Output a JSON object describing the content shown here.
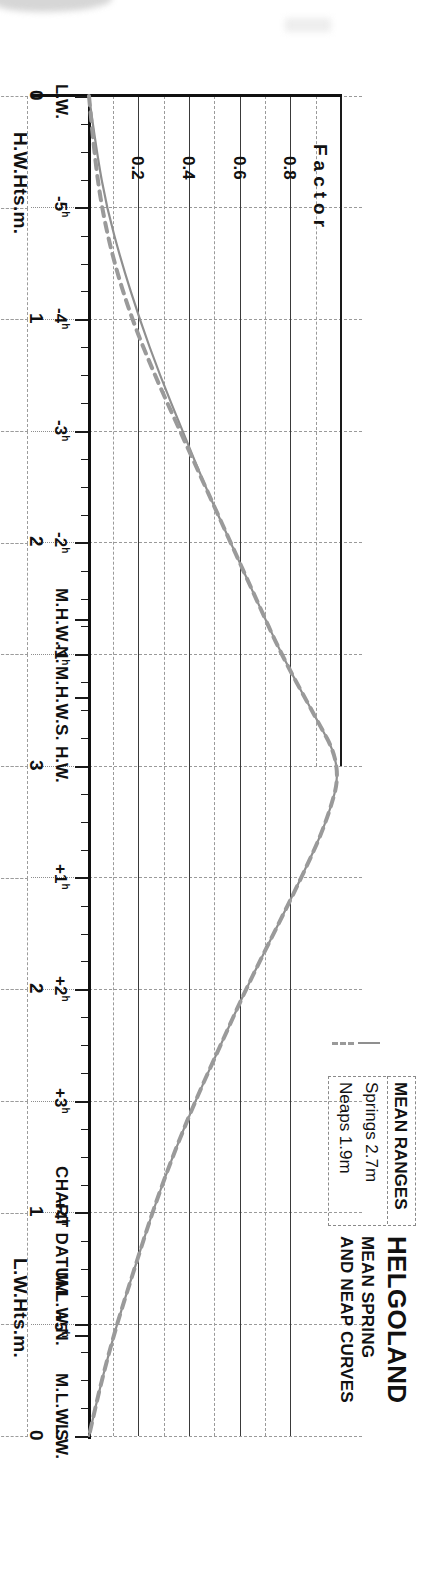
{
  "document": {
    "title": "HELGOLAND",
    "subtitle_line1": "MEAN SPRING",
    "subtitle_line2": "AND NEAP CURVES",
    "chart_datum_label": "CHART DATUM"
  },
  "legend": {
    "header": "MEAN RANGES",
    "entries": [
      {
        "label": "Springs 2.7m",
        "style": "solid",
        "color": "#8f8f8f"
      },
      {
        "label": "Neaps 1.9m",
        "style": "dashed",
        "color": "#9a9a9a"
      }
    ]
  },
  "axes": {
    "high_water": {
      "name": "H.W.Hts.m.",
      "ticks": [
        "0",
        "1",
        "2",
        "3"
      ],
      "markers": [
        {
          "label": "M.H.W.S.",
          "value": 2.7
        },
        {
          "label": "M.H.W.N.",
          "value": 2.35
        }
      ]
    },
    "low_water": {
      "name": "L.W.Hts.m.",
      "ticks": [
        "0",
        "1",
        "2"
      ],
      "markers": [
        {
          "label": "M.L.W.N.",
          "value": 0.45
        },
        {
          "label": "M.L.W.S.",
          "value": 0.0
        }
      ]
    },
    "time": {
      "labels": [
        "L.W.",
        "-5",
        "-4",
        "-3",
        "-2",
        "-1",
        "H.W.",
        "+1",
        "+2",
        "+3",
        "+4",
        "+5",
        "L.W."
      ],
      "superscript": "h",
      "hw_label": "H.W.",
      "lw_label": "L.W."
    },
    "factor": {
      "name": "Factor",
      "ticks": [
        "0.8",
        "0.6",
        "0.4",
        "0.2"
      ]
    }
  },
  "chart_data": {
    "type": "line",
    "xlabel": "Factor",
    "ylabel": "Hours from High Water",
    "xlim": [
      0,
      1
    ],
    "ylim": [
      -6,
      6
    ],
    "grid": true,
    "legend_position": "top-right",
    "x": [
      -6,
      -5.5,
      -5,
      -4.5,
      -4,
      -3.5,
      -3,
      -2.5,
      -2,
      -1.5,
      -1,
      -0.5,
      0,
      0.5,
      1,
      1.5,
      2,
      2.5,
      3,
      3.5,
      4,
      4.5,
      5,
      5.5,
      6
    ],
    "series": [
      {
        "name": "Springs 2.7m",
        "style": "solid",
        "values": [
          0.0,
          0.03,
          0.07,
          0.13,
          0.2,
          0.28,
          0.37,
          0.46,
          0.56,
          0.66,
          0.76,
          0.88,
          1.0,
          0.94,
          0.84,
          0.73,
          0.62,
          0.52,
          0.42,
          0.33,
          0.25,
          0.18,
          0.11,
          0.05,
          0.0
        ]
      },
      {
        "name": "Neaps 1.9m",
        "style": "dashed",
        "values": [
          0.0,
          0.02,
          0.05,
          0.1,
          0.17,
          0.26,
          0.36,
          0.46,
          0.56,
          0.66,
          0.76,
          0.88,
          1.0,
          0.94,
          0.84,
          0.73,
          0.62,
          0.52,
          0.42,
          0.33,
          0.25,
          0.18,
          0.11,
          0.05,
          0.0
        ]
      }
    ],
    "annotations": [
      "M.H.W.S. 2.7",
      "M.H.W.N. 2.35",
      "M.L.W.N. 0.45",
      "M.L.W.S. 0.0",
      "CHART DATUM"
    ]
  }
}
